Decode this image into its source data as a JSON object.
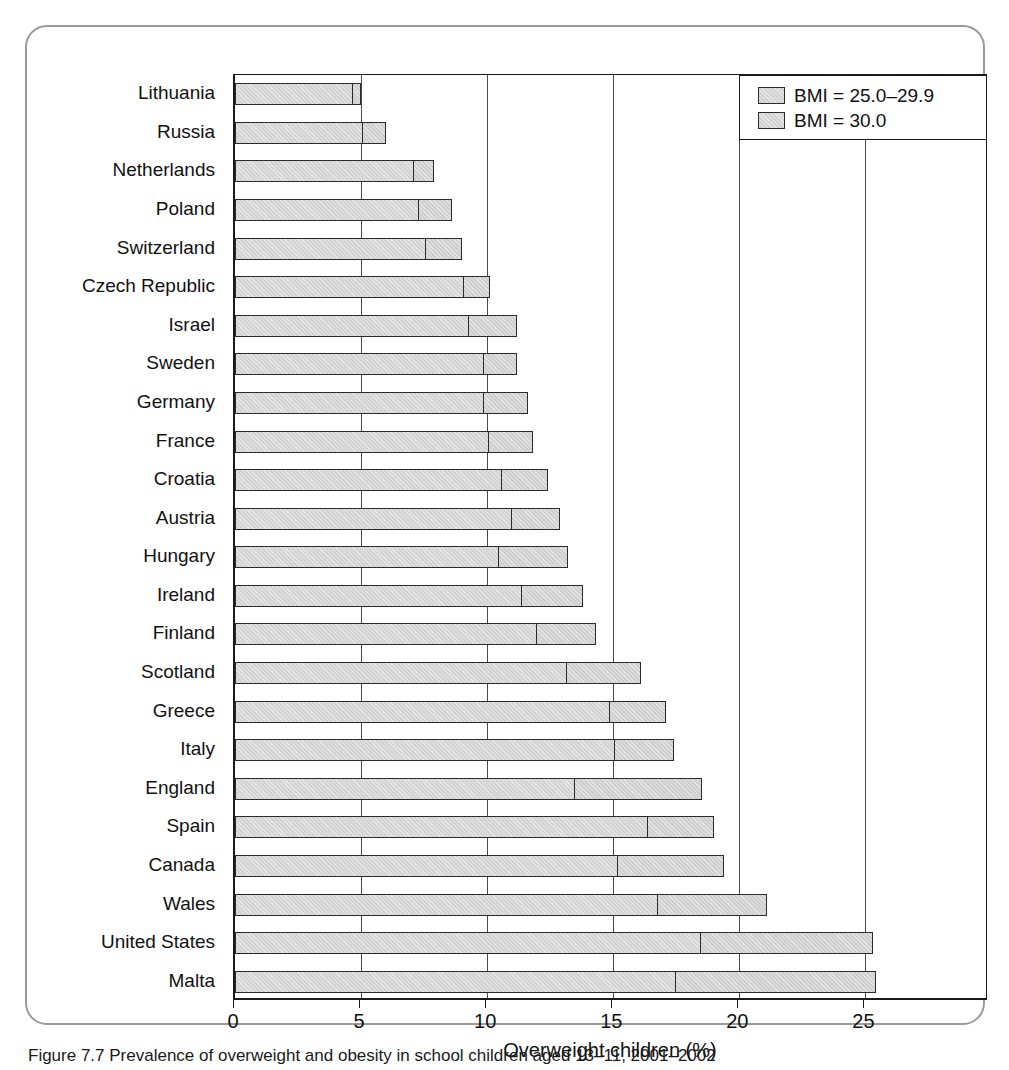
{
  "chart_data": {
    "type": "bar",
    "orientation": "horizontal",
    "stacked": true,
    "title": "",
    "xlabel": "Overweight children (%)",
    "ylabel": "",
    "xlim": [
      0,
      29.9
    ],
    "xticks": [
      0,
      5,
      10,
      15,
      20,
      25
    ],
    "xtick_labels": [
      "0",
      "5",
      "10",
      "15",
      "20",
      "25"
    ],
    "grid": "vertical",
    "legend_position": "top-right",
    "categories": [
      "Lithuania",
      "Russia",
      "Netherlands",
      "Poland",
      "Switzerland",
      "Czech Republic",
      "Israel",
      "Sweden",
      "Germany",
      "France",
      "Croatia",
      "Austria",
      "Hungary",
      "Ireland",
      "Finland",
      "Scotland",
      "Greece",
      "Italy",
      "England",
      "Spain",
      "Canada",
      "Wales",
      "United States",
      "Malta"
    ],
    "series": [
      {
        "name": "BMI = 25.0–29.9",
        "color": "#d3d3d3",
        "values": [
          4.7,
          5.1,
          7.1,
          7.3,
          7.6,
          9.1,
          9.3,
          9.9,
          9.9,
          10.1,
          10.6,
          11.0,
          10.5,
          11.4,
          12.0,
          13.2,
          14.9,
          15.1,
          13.5,
          16.4,
          15.2,
          16.8,
          18.5,
          17.5
        ]
      },
      {
        "name": "BMI = 30.0",
        "color": "#cfcfcf",
        "values": [
          0.3,
          0.9,
          0.8,
          1.3,
          1.4,
          1.0,
          1.9,
          1.3,
          1.7,
          1.7,
          1.8,
          1.9,
          2.7,
          2.4,
          2.3,
          2.9,
          2.2,
          2.3,
          5.0,
          2.6,
          4.2,
          4.3,
          6.8,
          7.9
        ]
      }
    ],
    "totals": [
      5.0,
      6.0,
      7.9,
      8.6,
      9.0,
      10.1,
      11.2,
      11.2,
      11.6,
      11.8,
      12.4,
      12.9,
      13.2,
      13.8,
      14.3,
      16.1,
      17.1,
      17.4,
      18.5,
      19.0,
      19.4,
      21.1,
      25.3,
      25.4
    ]
  },
  "legend": {
    "entries": [
      {
        "label": "BMI = 25.0–29.9"
      },
      {
        "label": "BMI = 30.0"
      }
    ]
  },
  "caption": {
    "text": "Figure 7.7  Prevalence of overweight and obesity in school children aged 13–11, 2001–2002"
  }
}
